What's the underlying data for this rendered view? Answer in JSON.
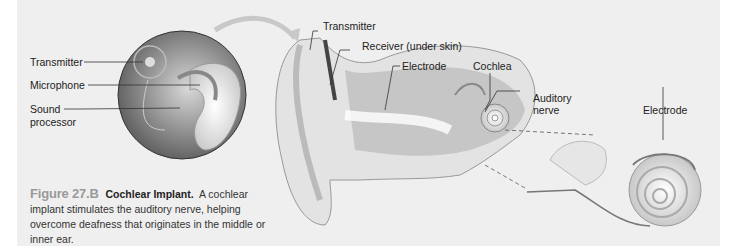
{
  "figure": {
    "number": "Figure 27.B",
    "title": "Cochlear Implant.",
    "caption": "A cochlear implant stimulates the auditory nerve, helping overcome deafness that originates in the middle or inner ear."
  },
  "labels": {
    "inset": {
      "transmitter": "Transmitter",
      "microphone": "Microphone",
      "sound_processor_line1": "Sound",
      "sound_processor_line2": "processor"
    },
    "ear": {
      "transmitter": "Transmitter",
      "receiver": "Receiver (under skin)",
      "electrode": "Electrode",
      "cochlea": "Cochlea",
      "auditory_nerve_line1": "Auditory",
      "auditory_nerve_line2": "nerve"
    },
    "cochlea_detail": {
      "electrode": "Electrode"
    }
  },
  "colors": {
    "panel_bg": "#efefef",
    "figure_number": "#9a9a9a",
    "text": "#222222"
  }
}
